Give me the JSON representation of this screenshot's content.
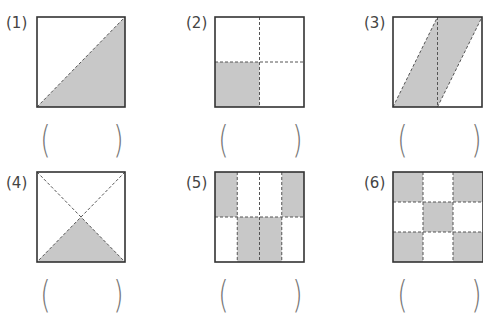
{
  "problems": [
    {
      "label": "(1)",
      "shape": "square with diagonal",
      "shaded": "lower-right triangle",
      "answer": ""
    },
    {
      "label": "(2)",
      "shape": "square in 4 quarters",
      "shaded": "bottom-left quarter",
      "answer": ""
    },
    {
      "label": "(3)",
      "shape": "square with parallelogram",
      "shaded": "parallelogram band",
      "answer": ""
    },
    {
      "label": "(4)",
      "shape": "square with both diagonals",
      "shaded": "bottom triangle",
      "answer": ""
    },
    {
      "label": "(5)",
      "shape": "square in 4 columns x 2 rows",
      "shaded": "top outer cells, bottom middle cells",
      "answer": ""
    },
    {
      "label": "(6)",
      "shape": "3x3 grid",
      "shaded": "checkerboard corners and center",
      "answer": ""
    }
  ],
  "paren_open": "(",
  "paren_close": ")",
  "colors": {
    "shade": "#c8c8c8",
    "stroke": "#333333",
    "dash": "#555555"
  }
}
